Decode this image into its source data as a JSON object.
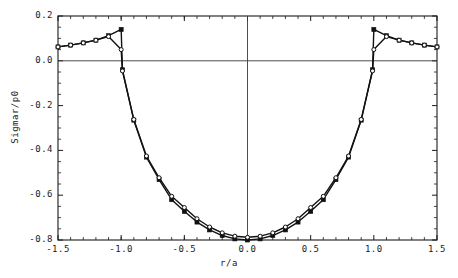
{
  "figure": {
    "background": "#ffffff",
    "frame_color": "#1a1a1a",
    "series_color": "#111111"
  },
  "axes": {
    "xlabel": "r/a",
    "ylabel": "Sigmar/p0",
    "xticks": [
      "-1.5",
      "-1.0",
      "-0.5",
      "0.0",
      "0.5",
      "1.0",
      "1.5"
    ],
    "yticks": [
      "0.2",
      "0.0",
      "-0.2",
      "-0.4",
      "-0.6",
      "-0.8"
    ]
  },
  "chart_data": {
    "type": "line",
    "title": "",
    "subtitle": "",
    "xlabel": "r/a",
    "ylabel": "Sigmar/p0",
    "xlim": [
      -1.5,
      1.5
    ],
    "ylim": [
      -0.8,
      0.2
    ],
    "xticks": [
      -1.5,
      -1.0,
      -0.5,
      0.0,
      0.5,
      1.0,
      1.5
    ],
    "yticks": [
      0.2,
      0.0,
      -0.2,
      -0.4,
      -0.6,
      -0.8
    ],
    "xtick_labels": [
      "-1.5",
      "-1.0",
      "-0.5",
      "0.0",
      "0.5",
      "1.0",
      "1.5"
    ],
    "ytick_labels": [
      "0.2",
      "0.0",
      "-0.2",
      "-0.4",
      "-0.6",
      "-0.8"
    ],
    "grid": false,
    "legend": null,
    "legend_position": "none",
    "annotations": [
      {
        "text": "zero reference line at Sigmar/p0 = 0.0",
        "y": 0.0
      },
      {
        "text": "vertical reference line at r/a = 0.0",
        "x": 0.0
      }
    ],
    "reference_lines": {
      "horizontal": [
        0.0
      ],
      "vertical": [
        0.0
      ]
    },
    "series": [
      {
        "name": "series-filled-square",
        "marker": "filled-square",
        "marker_size": 4,
        "line": "solid",
        "x": [
          -1.5,
          -1.4,
          -1.3,
          -1.2,
          -1.1,
          -1.0,
          -0.99,
          -0.9,
          -0.8,
          -0.7,
          -0.6,
          -0.5,
          -0.4,
          -0.3,
          -0.2,
          -0.1,
          0.0,
          0.1,
          0.2,
          0.3,
          0.4,
          0.5,
          0.6,
          0.7,
          0.8,
          0.9,
          0.99,
          1.0,
          1.1,
          1.2,
          1.3,
          1.4,
          1.5
        ],
        "y": [
          0.062,
          0.07,
          0.08,
          0.092,
          0.112,
          0.14,
          -0.04,
          -0.265,
          -0.43,
          -0.53,
          -0.62,
          -0.672,
          -0.72,
          -0.755,
          -0.78,
          -0.795,
          -0.8,
          -0.795,
          -0.78,
          -0.755,
          -0.72,
          -0.672,
          -0.62,
          -0.53,
          -0.43,
          -0.265,
          -0.04,
          0.14,
          0.112,
          0.092,
          0.08,
          0.07,
          0.062
        ]
      },
      {
        "name": "series-open-circle",
        "marker": "open-circle",
        "marker_size": 4,
        "line": "solid",
        "x": [
          -1.5,
          -1.4,
          -1.3,
          -1.2,
          -1.1,
          -1.0,
          -0.99,
          -0.9,
          -0.8,
          -0.7,
          -0.6,
          -0.5,
          -0.4,
          -0.3,
          -0.2,
          -0.1,
          0.0,
          0.1,
          0.2,
          0.3,
          0.4,
          0.5,
          0.6,
          0.7,
          0.8,
          0.9,
          0.99,
          1.0,
          1.1,
          1.2,
          1.3,
          1.4,
          1.5
        ],
        "y": [
          0.062,
          0.07,
          0.08,
          0.092,
          0.108,
          0.05,
          -0.045,
          -0.262,
          -0.425,
          -0.522,
          -0.605,
          -0.655,
          -0.705,
          -0.742,
          -0.768,
          -0.783,
          -0.788,
          -0.783,
          -0.768,
          -0.742,
          -0.705,
          -0.655,
          -0.605,
          -0.522,
          -0.425,
          -0.262,
          -0.045,
          0.05,
          0.108,
          0.092,
          0.08,
          0.07,
          0.062
        ]
      }
    ]
  }
}
